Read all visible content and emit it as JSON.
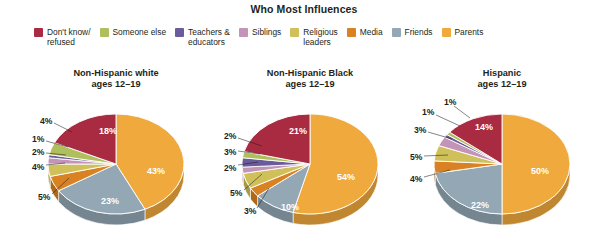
{
  "title": "Who Most Influences",
  "legend": {
    "position": "top",
    "items": [
      {
        "label": "Don't know/\nrefused",
        "color": "#A82B41"
      },
      {
        "label": "Someone else",
        "color": "#AFBF5B"
      },
      {
        "label": "Teachers &\neducators",
        "color": "#6A5B9B"
      },
      {
        "label": "Siblings",
        "color": "#C394B8"
      },
      {
        "label": "Religious\nleaders",
        "color": "#CFC05A"
      },
      {
        "label": "Media",
        "color": "#D98223"
      },
      {
        "label": "Friends",
        "color": "#93A7B5"
      },
      {
        "label": "Parents",
        "color": "#F0A93C"
      }
    ]
  },
  "chart_data": {
    "type": "pie",
    "title": "Who Most Influences",
    "xlabel": "",
    "ylabel": "",
    "unit": "percent",
    "categories": [
      "Parents",
      "Friends",
      "Media",
      "Religious leaders",
      "Siblings",
      "Teachers & educators",
      "Someone else",
      "Don't know/refused"
    ],
    "colors": [
      "#F0A93C",
      "#93A7B5",
      "#D98223",
      "#CFC05A",
      "#C394B8",
      "#6A5B9B",
      "#AFBF5B",
      "#A82B41"
    ],
    "series": [
      {
        "name": "Non-Hispanic white\nages 12–19",
        "values": [
          43,
          23,
          5,
          4,
          2,
          1,
          4,
          18
        ],
        "labels": [
          "43%",
          "23%",
          "5%",
          "4%",
          "2%",
          "1%",
          "4%",
          "18%"
        ]
      },
      {
        "name": "Non-Hispanic Black\nages 12–19",
        "values": [
          54,
          10,
          3,
          5,
          2,
          3,
          2,
          21
        ],
        "labels": [
          "54%",
          "10%",
          "3%",
          "5%",
          "2%",
          "3%",
          "2%",
          "21%"
        ]
      },
      {
        "name": "Hispanic\nages 12–19",
        "values": [
          50,
          22,
          4,
          5,
          3,
          1,
          1,
          14
        ],
        "labels": [
          "50%",
          "22%",
          "4%",
          "5%",
          "3%",
          "1%",
          "1%",
          "14%"
        ]
      }
    ]
  },
  "pies": [
    {
      "caption": "Non-Hispanic white\nages 12–19",
      "inside": [
        {
          "text": "43%",
          "x": 40,
          "y": 10
        },
        {
          "text": "23%",
          "x": -6,
          "y": 40
        },
        {
          "text": "18%",
          "x": -8,
          "y": -30
        }
      ],
      "callouts": [
        {
          "text": "4%",
          "tx": -76,
          "ty": -43,
          "x1": -62,
          "y1": -41,
          "x2": -44,
          "y2": -32
        },
        {
          "text": "1%",
          "tx": -84,
          "ty": -25,
          "x1": -70,
          "y1": -23,
          "x2": -48,
          "y2": -17
        },
        {
          "text": "2%",
          "tx": -84,
          "ty": -12,
          "x1": -70,
          "y1": -11,
          "x2": -50,
          "y2": -9
        },
        {
          "text": "4%",
          "tx": -84,
          "ty": 3,
          "x1": -70,
          "y1": 1,
          "x2": -51,
          "y2": -1
        },
        {
          "text": "5%",
          "tx": -78,
          "ty": 33,
          "x1": -64,
          "y1": 30,
          "x2": -47,
          "y2": 14
        }
      ]
    },
    {
      "caption": "Non-Hispanic Black\nages 12–19",
      "inside": [
        {
          "text": "54%",
          "x": 36,
          "y": 16
        },
        {
          "text": "10%",
          "x": -20,
          "y": 46
        },
        {
          "text": "21%",
          "x": -12,
          "y": -30
        }
      ],
      "callouts": [
        {
          "text": "2%",
          "tx": -86,
          "ty": -28,
          "x1": -72,
          "y1": -26,
          "x2": -48,
          "y2": -18
        },
        {
          "text": "3%",
          "tx": -86,
          "ty": -12,
          "x1": -72,
          "y1": -13,
          "x2": -50,
          "y2": -10
        },
        {
          "text": "2%",
          "tx": -86,
          "ty": 4,
          "x1": -72,
          "y1": 1,
          "x2": -52,
          "y2": -2
        },
        {
          "text": "5%",
          "tx": -80,
          "ty": 29,
          "x1": -66,
          "y1": 26,
          "x2": -48,
          "y2": 10
        },
        {
          "text": "3%",
          "tx": -66,
          "ty": 47,
          "x1": -53,
          "y1": 44,
          "x2": -41,
          "y2": 24
        }
      ]
    },
    {
      "caption": "Hispanic\nages 12–19",
      "inside": [
        {
          "text": "50%",
          "x": 38,
          "y": 10
        },
        {
          "text": "22%",
          "x": -22,
          "y": 44
        },
        {
          "text": "14%",
          "x": -18,
          "y": -34
        }
      ],
      "callouts": [
        {
          "text": "1%",
          "tx": -58,
          "ty": -62,
          "x1": -48,
          "y1": -58,
          "x2": -32,
          "y2": -46
        },
        {
          "text": "1%",
          "tx": -80,
          "ty": -52,
          "x1": -66,
          "y1": -49,
          "x2": -42,
          "y2": -38
        },
        {
          "text": "3%",
          "tx": -88,
          "ty": -34,
          "x1": -74,
          "y1": -32,
          "x2": -50,
          "y2": -25
        },
        {
          "text": "5%",
          "tx": -92,
          "ty": -7,
          "x1": -78,
          "y1": -8,
          "x2": -54,
          "y2": -9
        },
        {
          "text": "4%",
          "tx": -92,
          "ty": 15,
          "x1": -78,
          "y1": 13,
          "x2": -52,
          "y2": 6
        }
      ]
    }
  ]
}
